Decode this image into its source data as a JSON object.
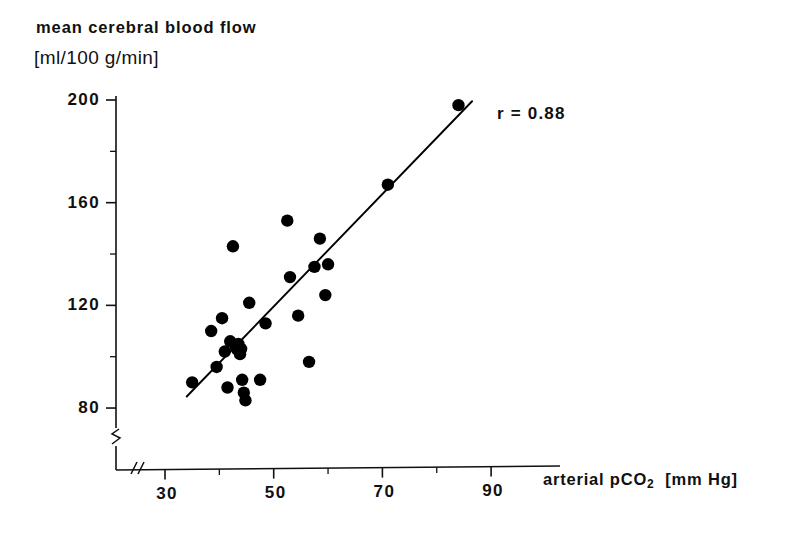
{
  "chart_data": {
    "type": "scatter",
    "title": "",
    "ylabel": "mean cerebral blood flow",
    "ylabel_units": "[ml/100 g/min]",
    "xlabel": "arterial pCO2 [mm Hg]",
    "xlabel_main": "arterial pCO",
    "xlabel_sub": "2",
    "xlabel_units": "[mm Hg]",
    "xlim": [
      26,
      95
    ],
    "ylim": [
      72,
      208
    ],
    "xticks": [
      30,
      50,
      70,
      90
    ],
    "xtick_labels": [
      "30",
      "50",
      "70",
      "90"
    ],
    "xminor_ticks": [
      40,
      60,
      80
    ],
    "yticks": [
      80,
      120,
      160,
      200
    ],
    "ytick_labels": [
      "80",
      "120",
      "160",
      "200"
    ],
    "yminor_ticks": [
      100,
      140,
      180
    ],
    "grid": false,
    "legend": "none",
    "axis_break_x": true,
    "axis_break_y": true,
    "annotation": "r = 0.88",
    "correlation": 0.88,
    "marker_color": "#000000",
    "line_color": "#000000",
    "points": [
      {
        "x": 35.0,
        "y": 90
      },
      {
        "x": 38.5,
        "y": 110
      },
      {
        "x": 39.5,
        "y": 96
      },
      {
        "x": 40.5,
        "y": 115
      },
      {
        "x": 41.0,
        "y": 102
      },
      {
        "x": 41.5,
        "y": 88
      },
      {
        "x": 42.0,
        "y": 106
      },
      {
        "x": 42.5,
        "y": 143
      },
      {
        "x": 43.0,
        "y": 104
      },
      {
        "x": 43.2,
        "y": 103
      },
      {
        "x": 43.5,
        "y": 105
      },
      {
        "x": 43.8,
        "y": 101
      },
      {
        "x": 44.0,
        "y": 103
      },
      {
        "x": 44.2,
        "y": 91
      },
      {
        "x": 44.5,
        "y": 86
      },
      {
        "x": 44.8,
        "y": 83
      },
      {
        "x": 45.5,
        "y": 121
      },
      {
        "x": 47.5,
        "y": 91
      },
      {
        "x": 48.5,
        "y": 113
      },
      {
        "x": 52.5,
        "y": 153
      },
      {
        "x": 53.0,
        "y": 131
      },
      {
        "x": 54.5,
        "y": 116
      },
      {
        "x": 56.5,
        "y": 98
      },
      {
        "x": 57.5,
        "y": 135
      },
      {
        "x": 58.5,
        "y": 146
      },
      {
        "x": 59.5,
        "y": 124
      },
      {
        "x": 60.0,
        "y": 136
      },
      {
        "x": 71.0,
        "y": 167
      },
      {
        "x": 84.0,
        "y": 198
      }
    ],
    "fit_line": {
      "x_start": 34.0,
      "y_start": 84.5,
      "x_end": 86.5,
      "y_end": 199.5
    }
  }
}
